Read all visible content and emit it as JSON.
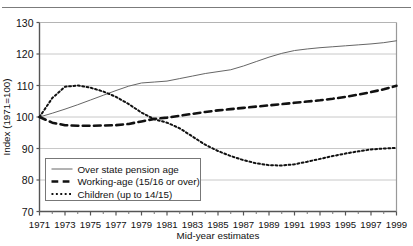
{
  "figure": {
    "top_rule": true,
    "background_color": "#ffffff"
  },
  "chart_data": {
    "type": "line",
    "title": "",
    "subtitle": "",
    "xlabel": "Mid-year estimates",
    "ylabel": "Index (1971=100)",
    "xlim": [
      1971,
      1999
    ],
    "ylim": [
      70,
      130
    ],
    "yticks": [
      70,
      80,
      90,
      100,
      110,
      120,
      130
    ],
    "xticks": [
      1971,
      1973,
      1975,
      1977,
      1979,
      1981,
      1983,
      1985,
      1987,
      1989,
      1991,
      1993,
      1995,
      1997,
      1999
    ],
    "xtick_labels": [
      "1971",
      "1973",
      "1975",
      "1977",
      "1979",
      "1981",
      "1983",
      "1985",
      "1987",
      "1989",
      "1991",
      "1993",
      "1995",
      "1997",
      "1999"
    ],
    "ytick_labels": [
      "70",
      "80",
      "90",
      "100",
      "110",
      "120",
      "130"
    ],
    "minor_xticks": [
      1972,
      1974,
      1976,
      1978,
      1980,
      1982,
      1984,
      1986,
      1988,
      1990,
      1992,
      1994,
      1996,
      1998
    ],
    "grid": "horizontal",
    "grid_color": "#c8c8c8",
    "axis_color": "#555555",
    "legend_position": "lower-left",
    "x": [
      1971,
      1972,
      1973,
      1974,
      1975,
      1976,
      1977,
      1978,
      1979,
      1980,
      1981,
      1982,
      1983,
      1984,
      1985,
      1986,
      1987,
      1988,
      1989,
      1990,
      1991,
      1992,
      1993,
      1994,
      1995,
      1996,
      1997,
      1998,
      1999
    ],
    "series": [
      {
        "name": "Over state pension age",
        "style": "solid",
        "color": "#666666",
        "width": 1,
        "values": [
          100.0,
          101.2,
          102.5,
          103.9,
          105.4,
          106.9,
          108.4,
          109.8,
          110.8,
          111.1,
          111.4,
          112.2,
          113.0,
          113.8,
          114.4,
          115.0,
          116.2,
          117.6,
          119.0,
          120.2,
          121.1,
          121.6,
          122.0,
          122.3,
          122.6,
          122.9,
          123.2,
          123.6,
          124.2
        ]
      },
      {
        "name": "Working-age (15/16 or over)",
        "style": "dashed",
        "color": "#111111",
        "width": 2.6,
        "values": [
          100.0,
          98.2,
          97.4,
          97.2,
          97.2,
          97.3,
          97.4,
          97.8,
          98.6,
          99.4,
          99.8,
          100.4,
          101.0,
          101.6,
          102.1,
          102.5,
          102.9,
          103.3,
          103.7,
          104.1,
          104.5,
          104.9,
          105.3,
          105.8,
          106.4,
          107.1,
          107.9,
          108.8,
          109.9
        ]
      },
      {
        "name": "Children (up to 14/15)",
        "style": "dotted",
        "color": "#111111",
        "width": 2.0,
        "values": [
          100.0,
          106.0,
          109.6,
          110.0,
          109.3,
          108.1,
          106.4,
          104.1,
          101.4,
          99.3,
          98.2,
          96.4,
          93.8,
          91.2,
          89.2,
          87.6,
          86.3,
          85.3,
          84.7,
          84.6,
          85.0,
          85.8,
          86.7,
          87.6,
          88.4,
          89.1,
          89.7,
          90.0,
          90.2
        ]
      }
    ],
    "legend": [
      {
        "label": "Over state pension age",
        "style": "solid",
        "color": "#666666"
      },
      {
        "label": "Working-age (15/16 or over)",
        "style": "dashed",
        "color": "#111111"
      },
      {
        "label": "Children (up to 14/15)",
        "style": "dotted",
        "color": "#111111"
      }
    ]
  }
}
